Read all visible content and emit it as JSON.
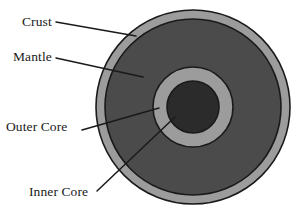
{
  "diagram": {
    "type": "concentric-circles",
    "center": {
      "x": 193,
      "y": 107
    },
    "background_color": "#ffffff",
    "outline_color": "#1a1a1a",
    "layers": [
      {
        "id": "crust",
        "label": "Crust",
        "radius": 97,
        "fill": "#9c9c9c",
        "label_position": {
          "x": 22,
          "y": 14
        },
        "leader_line": {
          "x1": 56,
          "y1": 22,
          "x2": 136,
          "y2": 36
        }
      },
      {
        "id": "mantle",
        "label": "Mantle",
        "radius": 88,
        "fill": "#4b4b4b",
        "label_position": {
          "x": 13,
          "y": 49
        },
        "leader_line": {
          "x1": 56,
          "y1": 58,
          "x2": 143,
          "y2": 77
        }
      },
      {
        "id": "outer-core",
        "label": "Outer Core",
        "radius": 40,
        "fill": "#9c9c9c",
        "label_position": {
          "x": 6,
          "y": 119
        },
        "leader_line": {
          "x1": 82,
          "y1": 130,
          "x2": 159,
          "y2": 108
        }
      },
      {
        "id": "inner-core",
        "label": "Inner Core",
        "radius": 26,
        "fill": "#2b2b2b",
        "label_position": {
          "x": 29,
          "y": 184
        },
        "leader_line": {
          "x1": 97,
          "y1": 191,
          "x2": 175,
          "y2": 117
        }
      }
    ]
  }
}
